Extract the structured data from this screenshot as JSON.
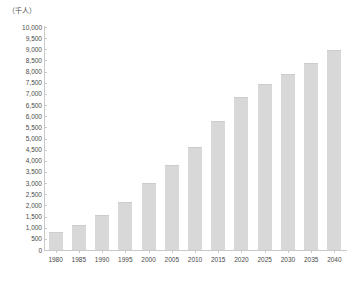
{
  "unit_caption": "（千人）",
  "chart_data": {
    "type": "bar",
    "title": "",
    "subtitle": "",
    "xlabel": "",
    "ylabel": "（千人）",
    "ylim": [
      0,
      10000
    ],
    "ytick_step": 500,
    "grid": false,
    "legend": null,
    "bar_color": "#d8d8d8",
    "axis_color": "#c9c9c9",
    "text_color": "#4a4a4a",
    "categories": [
      "1980",
      "1985",
      "1990",
      "1995",
      "2000",
      "2005",
      "2010",
      "2015",
      "2020",
      "2025",
      "2030",
      "2035",
      "2040"
    ],
    "values": [
      830,
      1100,
      1580,
      2150,
      3000,
      3800,
      4600,
      5800,
      6850,
      7450,
      7900,
      8400,
      8950
    ],
    "ytick_labels": [
      "10,000",
      "9,500",
      "9,000",
      "8,500",
      "8,000",
      "7,500",
      "7,000",
      "6,500",
      "6,000",
      "5,500",
      "5,000",
      "4,500",
      "4,000",
      "3,500",
      "3,000",
      "2,500",
      "2,000",
      "1,500",
      "1,000",
      "500",
      "0"
    ],
    "ytick_values": [
      10000,
      9500,
      9000,
      8500,
      8000,
      7500,
      7000,
      6500,
      6000,
      5500,
      5000,
      4500,
      4000,
      3500,
      3000,
      2500,
      2000,
      1500,
      1000,
      500,
      0
    ]
  }
}
